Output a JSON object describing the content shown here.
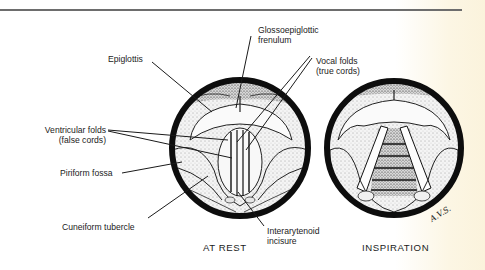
{
  "figure": {
    "views": [
      {
        "id": "at-rest",
        "caption": "AT REST"
      },
      {
        "id": "inspiration",
        "caption": "INSPIRATION"
      }
    ],
    "labels": {
      "glossoepiglottic_frenulum": {
        "line1": "Glossoepiglottic",
        "line2": "frenulum"
      },
      "epiglottis": {
        "line1": "Epiglottis"
      },
      "vocal_folds": {
        "line1": "Vocal folds",
        "line2": "(true cords)"
      },
      "ventricular_folds": {
        "line1": "Ventricular folds",
        "line2": "(false cords)"
      },
      "piriform_fossa": {
        "line1": "Piriform fossa"
      },
      "cuneiform_tubercle": {
        "line1": "Cuneiform tubercle"
      },
      "interarytenoid_incisure": {
        "line1": "Interarytenoid",
        "line2": "incisure"
      }
    },
    "signature": "A.V.S.",
    "colors": {
      "ink": "#111111",
      "rule": "#6d6d6d",
      "tissue": "#f2f2f2",
      "paper_edge": "#fbf3dc"
    }
  }
}
